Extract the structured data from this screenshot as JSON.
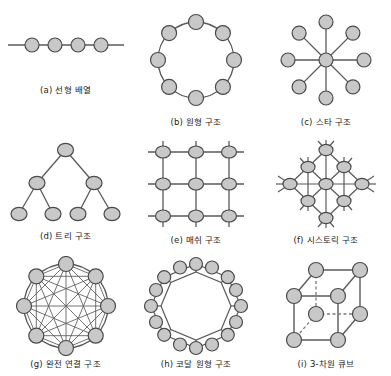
{
  "figure": {
    "node_fill": "#c8c8c8",
    "node_stroke": "#4a4a4a",
    "edge_color": "#5a5a5a",
    "caption_color": "#1a1a1a",
    "background": "#ffffff",
    "panels": [
      {
        "key": "a",
        "caption": "(a) 선형 배열",
        "topology": "linear-array",
        "node_count": 4
      },
      {
        "key": "b",
        "caption": "(b) 원형 구조",
        "topology": "ring",
        "node_count": 8
      },
      {
        "key": "c",
        "caption": "(c) 스타 구조",
        "topology": "star",
        "node_count": 9
      },
      {
        "key": "d",
        "caption": "(d) 트리 구조",
        "topology": "binary-tree",
        "node_count": 7
      },
      {
        "key": "e",
        "caption": "(e) 매쉬 구조",
        "topology": "mesh",
        "node_count": 9
      },
      {
        "key": "f",
        "caption": "(f) 시스토릭 구조",
        "topology": "systolic",
        "node_count": 9
      },
      {
        "key": "g",
        "caption": "(g) 완전 연결 구조",
        "topology": "fully-connected",
        "node_count": 8
      },
      {
        "key": "h",
        "caption": "(h) 코달 원형 구조",
        "topology": "chordal-ring",
        "node_count": 16
      },
      {
        "key": "i",
        "caption": "(i) 3-차원 큐브",
        "topology": "hypercube-3d",
        "node_count": 8
      }
    ]
  }
}
